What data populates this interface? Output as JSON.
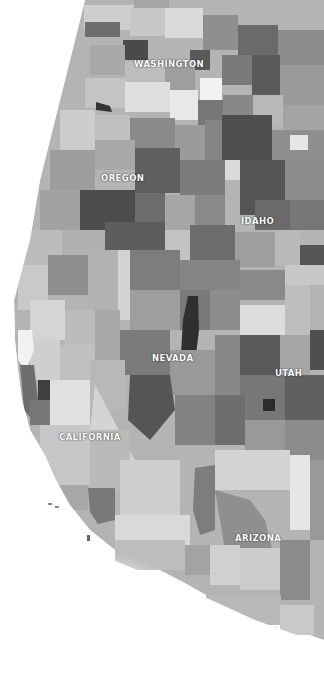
{
  "map": {
    "type": "choropleth",
    "region": "Western United States (counties)",
    "color_scale": [
      "#f4f4f4",
      "#d6d6d6",
      "#b9b9b9",
      "#9a9a9a",
      "#7c7c7c",
      "#5e5e5e",
      "#3a3a3a"
    ],
    "states": [
      {
        "name": "WASHINGTON",
        "x": 134,
        "y": 59
      },
      {
        "name": "OREGON",
        "x": 101,
        "y": 173
      },
      {
        "name": "IDAHO",
        "x": 241,
        "y": 216
      },
      {
        "name": "NEVADA",
        "x": 152,
        "y": 353
      },
      {
        "name": "UTAH",
        "x": 275,
        "y": 368
      },
      {
        "name": "CALIFORNIA",
        "x": 59,
        "y": 432
      },
      {
        "name": "ARIZONA",
        "x": 235,
        "y": 533
      }
    ]
  }
}
